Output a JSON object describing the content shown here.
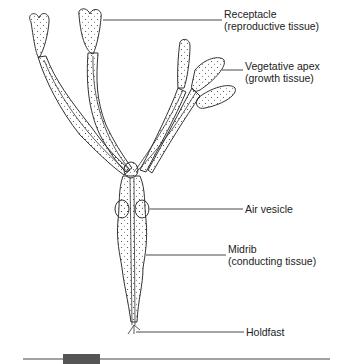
{
  "diagram": {
    "labels": [
      {
        "id": "receptacle",
        "line1": "Receptacle",
        "line2": "(reproductive tissue)"
      },
      {
        "id": "vegetative-apex",
        "line1": "Vegetative apex",
        "line2": "(growth tissue)"
      },
      {
        "id": "air-vesicle",
        "line1": "Air vesicle",
        "line2": ""
      },
      {
        "id": "midrib",
        "line1": "Midrib",
        "line2": "(conducting tissue)"
      },
      {
        "id": "holdfast",
        "line1": "Holdfast",
        "line2": ""
      }
    ]
  },
  "colors": {
    "ink": "#333333",
    "footer_block": "#555555"
  }
}
